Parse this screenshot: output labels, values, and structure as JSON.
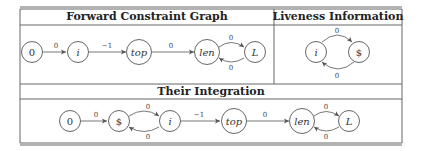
{
  "table": {
    "headers": {
      "forward": "Forward Constraint Graph",
      "liveness": "Liveness Information",
      "integration": "Their Integration"
    }
  },
  "forward_graph": {
    "nodes": [
      {
        "id": "n0",
        "label": "0",
        "italic": false
      },
      {
        "id": "ni",
        "label": "i",
        "italic": true
      },
      {
        "id": "ntop",
        "label": "top",
        "italic": true
      },
      {
        "id": "nlen",
        "label": "len",
        "italic": true
      },
      {
        "id": "nL",
        "label": "L",
        "italic": true
      }
    ],
    "edges": [
      {
        "from": "0",
        "to": "i",
        "label": "0"
      },
      {
        "from": "i",
        "to": "top",
        "label": "−1"
      },
      {
        "from": "top",
        "to": "len",
        "label": "0"
      },
      {
        "from": "len",
        "to": "L",
        "label": "0"
      },
      {
        "from": "L",
        "to": "len",
        "label": "0"
      }
    ]
  },
  "liveness_graph": {
    "nodes": [
      {
        "id": "ni",
        "label": "i",
        "italic": true
      },
      {
        "id": "ndollar",
        "label": "$",
        "italic": false
      }
    ],
    "edges": [
      {
        "from": "i",
        "to": "$",
        "label": "0"
      },
      {
        "from": "$",
        "to": "i",
        "label": "0"
      }
    ]
  },
  "integration_graph": {
    "nodes": [
      {
        "id": "n0",
        "label": "0",
        "italic": false
      },
      {
        "id": "ndollar",
        "label": "$",
        "italic": false
      },
      {
        "id": "ni",
        "label": "i",
        "italic": true
      },
      {
        "id": "ntop",
        "label": "top",
        "italic": true
      },
      {
        "id": "nlen",
        "label": "len",
        "italic": true
      },
      {
        "id": "nL",
        "label": "L",
        "italic": true
      }
    ],
    "edges": [
      {
        "from": "0",
        "to": "$",
        "label": "0"
      },
      {
        "from": "$",
        "to": "i",
        "label": "0"
      },
      {
        "from": "i",
        "to": "$",
        "label": "0"
      },
      {
        "from": "i",
        "to": "top",
        "label": "−1"
      },
      {
        "from": "top",
        "to": "len",
        "label": "0"
      },
      {
        "from": "len",
        "to": "L",
        "label": "0"
      },
      {
        "from": "L",
        "to": "len",
        "label": "0"
      }
    ]
  }
}
